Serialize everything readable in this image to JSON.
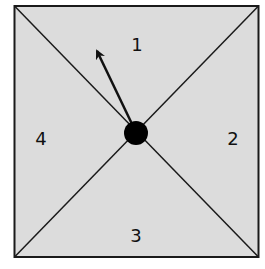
{
  "diagram": {
    "type": "square-quadrant-diagram",
    "colors": {
      "fill": "#dcdcdc",
      "stroke": "#1a1a1a",
      "dot": "#000000",
      "background": "#ffffff"
    },
    "regions": [
      {
        "id": "top",
        "label": "1"
      },
      {
        "id": "right",
        "label": "2"
      },
      {
        "id": "bottom",
        "label": "3"
      },
      {
        "id": "left",
        "label": "4"
      }
    ],
    "center_dot": "center-point",
    "arrow": "direction-arrow pointing up-left into region 1"
  }
}
